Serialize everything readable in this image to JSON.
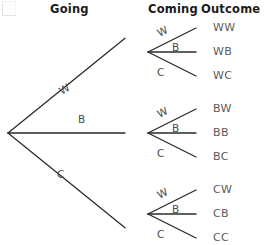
{
  "diagram": {
    "title_row": {
      "going": "Going",
      "coming": "Coming",
      "outcome": "Outcome"
    },
    "corner_mark": "corner-bracket"
  },
  "chart_data": {
    "type": "diagram",
    "subtype": "probability-tree",
    "title": "",
    "columns": [
      "Going",
      "Coming",
      "Outcome"
    ],
    "stage1_labels": [
      "W",
      "B",
      "C"
    ],
    "stage2_labels": [
      "W",
      "B",
      "C"
    ],
    "outcomes": [
      "WW",
      "WB",
      "WC",
      "BW",
      "BB",
      "BC",
      "CW",
      "CB",
      "CC"
    ],
    "root": {
      "x": 8,
      "y": 133
    },
    "stage1_nodes": [
      {
        "label": "W",
        "x": 148,
        "y": 52
      },
      {
        "label": "B",
        "x": 148,
        "y": 133
      },
      {
        "label": "C",
        "x": 148,
        "y": 214
      }
    ],
    "stage2_nodes": [
      {
        "outcome": "WW",
        "x": 196,
        "y": 28
      },
      {
        "outcome": "WB",
        "x": 196,
        "y": 52
      },
      {
        "outcome": "WC",
        "x": 196,
        "y": 76
      },
      {
        "outcome": "BW",
        "x": 196,
        "y": 109
      },
      {
        "outcome": "BB",
        "x": 196,
        "y": 133
      },
      {
        "outcome": "BC",
        "x": 196,
        "y": 157
      },
      {
        "outcome": "CW",
        "x": 196,
        "y": 190
      },
      {
        "outcome": "CB",
        "x": 196,
        "y": 214
      },
      {
        "outcome": "CC",
        "x": 196,
        "y": 238
      }
    ],
    "stage1_edge_labels": [
      {
        "label": "W",
        "x": 59,
        "y": 83,
        "rotation": -31
      },
      {
        "label": "B",
        "x": 78,
        "y": 113,
        "rotation": 0
      },
      {
        "label": "C",
        "x": 57,
        "y": 168,
        "rotation": 0
      }
    ],
    "stage2_edge_labels": [
      {
        "label": "W",
        "x": 157,
        "y": 25,
        "rotation": -27
      },
      {
        "label": "B",
        "x": 172,
        "y": 41,
        "rotation": 0
      },
      {
        "label": "C",
        "x": 157,
        "y": 66,
        "rotation": 0
      },
      {
        "label": "W",
        "x": 157,
        "y": 106,
        "rotation": -27
      },
      {
        "label": "B",
        "x": 172,
        "y": 122,
        "rotation": 0
      },
      {
        "label": "C",
        "x": 157,
        "y": 147,
        "rotation": 0
      },
      {
        "label": "W",
        "x": 157,
        "y": 187,
        "rotation": -27
      },
      {
        "label": "B",
        "x": 172,
        "y": 203,
        "rotation": 0
      },
      {
        "label": "C",
        "x": 157,
        "y": 228,
        "rotation": 0
      }
    ],
    "line_color": "#2b2b2b",
    "text_color": "#5b5b5b",
    "header_color": "#1b1b1b",
    "background": "#ffffff"
  }
}
